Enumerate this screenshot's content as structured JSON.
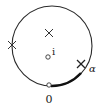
{
  "diagram": {
    "type": "complex-plane-contour",
    "circle": {
      "cx": 52,
      "cy": 46,
      "r": 40,
      "color": "#2a2a2a"
    },
    "poles": [
      {
        "name": "pole-top",
        "x": 49,
        "y": 34
      },
      {
        "name": "pole-left",
        "x": 12,
        "y": 46
      },
      {
        "name": "pole-alpha",
        "x": 81,
        "y": 67
      }
    ],
    "points": [
      {
        "name": "point-i",
        "x": 47,
        "y": 57,
        "label": "i"
      },
      {
        "name": "point-zero",
        "x": 49,
        "y": 85,
        "label": "0"
      }
    ],
    "labels": {
      "i": "i",
      "zero": "0",
      "alpha": "α"
    },
    "highlighted_arc": {
      "from": "0",
      "to": "α"
    }
  }
}
